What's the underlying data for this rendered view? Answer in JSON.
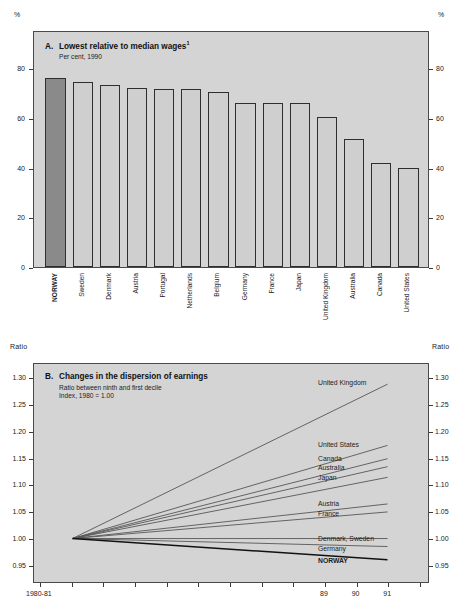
{
  "chart_data": [
    {
      "type": "bar",
      "panel": "A",
      "letter": "A.",
      "title": "Lowest relative to median wages",
      "title_footnote": "1",
      "subtitle": "Per cent, 1990",
      "unit_left": "%",
      "unit_right": "%",
      "ylabel": "%",
      "xlabel": "",
      "ylim": [
        0,
        90
      ],
      "yticks": [
        0,
        20,
        40,
        60,
        80
      ],
      "ytick_labels": [
        "0",
        "20",
        "40",
        "60",
        "80"
      ],
      "grid": false,
      "highlight_category": "NORWAY",
      "highlight_color": "#8a8a8a",
      "bar_color": "#cfcfcf",
      "categories": [
        "NORWAY",
        "Sweden",
        "Denmark",
        "Austria",
        "Portugal",
        "Netherlands",
        "Belgium",
        "Germany",
        "France",
        "Japan",
        "United Kingdom",
        "Australia",
        "Canada",
        "United States"
      ],
      "values": [
        76,
        74.5,
        73,
        72,
        71.5,
        71.5,
        70.5,
        66,
        66,
        66,
        60.5,
        51.5,
        42,
        40
      ]
    },
    {
      "type": "line",
      "panel": "B",
      "letter": "B.",
      "title": "Changes in the dispersion of earnings",
      "subtitle_1": "Ratio between ninth and first decile",
      "subtitle_2": "Index, 1980 = 1.00",
      "unit_left": "Ratio",
      "unit_right": "Ratio",
      "ylabel": "Ratio",
      "xlabel": "",
      "ylim": [
        0.94,
        1.325
      ],
      "yticks": [
        0.95,
        1.0,
        1.05,
        1.1,
        1.15,
        1.2,
        1.25,
        1.3
      ],
      "ytick_labels": [
        "0.95",
        "1.00",
        "1.05",
        "1.10",
        "1.15",
        "1.20",
        "1.25",
        "1.30"
      ],
      "xlim": [
        1980,
        1992
      ],
      "xticks": [
        1980,
        1981,
        1982,
        1983,
        1984,
        1985,
        1986,
        1987,
        1988,
        1989,
        1990,
        1991,
        1992
      ],
      "xtick_labels": [
        "1980-81",
        "",
        "",
        "",
        "",
        "",
        "",
        "",
        "",
        "89",
        "90",
        "91",
        ""
      ],
      "x_start": 1981,
      "x_end": 1991,
      "grid": false,
      "legend_position": "right-inline",
      "series": [
        {
          "name": "United Kingdom",
          "start": 1.0,
          "end": 1.29,
          "bold": false
        },
        {
          "name": "United States",
          "start": 1.0,
          "end": 1.175,
          "bold": false
        },
        {
          "name": "Canada",
          "start": 1.0,
          "end": 1.15,
          "bold": false
        },
        {
          "name": "Australia",
          "start": 1.0,
          "end": 1.135,
          "bold": false
        },
        {
          "name": "Japan",
          "start": 1.0,
          "end": 1.115,
          "bold": false
        },
        {
          "name": "Austria",
          "start": 1.0,
          "end": 1.065,
          "bold": false
        },
        {
          "name": "France",
          "start": 1.0,
          "end": 1.05,
          "bold": false
        },
        {
          "name": "Denmark, Sweden",
          "start": 1.0,
          "end": 1.0,
          "bold": false
        },
        {
          "name": "Germany",
          "start": 1.0,
          "end": 0.985,
          "bold": false
        },
        {
          "name": "NORWAY",
          "start": 1.0,
          "end": 0.96,
          "bold": true
        }
      ]
    }
  ]
}
